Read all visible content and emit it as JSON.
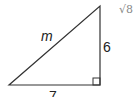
{
  "diagram": {
    "type": "right-triangle",
    "labels": {
      "hypotenuse": "m",
      "vertical_leg": "6",
      "horizontal_leg": "7",
      "partial_expression": "√8"
    },
    "vertices": {
      "left": [
        9,
        85
      ],
      "right_angle": [
        100,
        85
      ],
      "top": [
        100,
        6
      ]
    },
    "stroke_color": "#333333"
  }
}
